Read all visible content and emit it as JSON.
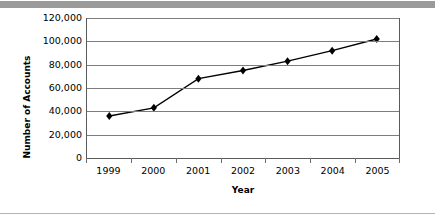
{
  "decor": {
    "top_bar_color": "#9a9a9a",
    "bottom_rule_color": "#b4b4b4"
  },
  "chart_data": {
    "type": "line",
    "title": "",
    "subtitle": "",
    "xlabel": "Year",
    "ylabel": "Number of Accounts",
    "categories": [
      "1999",
      "2000",
      "2001",
      "2002",
      "2003",
      "2004",
      "2005"
    ],
    "values": [
      36000,
      43000,
      68000,
      75000,
      83000,
      92000,
      102000
    ],
    "series": [
      {
        "name": "Number of Accounts",
        "values": [
          36000,
          43000,
          68000,
          75000,
          83000,
          92000,
          102000
        ]
      }
    ],
    "ylim": [
      0,
      120000
    ],
    "ytick_labels": [
      "0",
      "20,000",
      "40,000",
      "60,000",
      "80,000",
      "100,000",
      "120,000"
    ],
    "ytick_values": [
      0,
      20000,
      40000,
      60000,
      80000,
      100000,
      120000
    ],
    "grid": true,
    "grid_axis": "y",
    "legend": false,
    "legend_position": "none",
    "marker": "diamond",
    "marker_color": "#000000",
    "line_color": "#000000",
    "grid_color": "#7d7d7d",
    "axis_color": "#5a5a5a",
    "plot_background": "#ffffff",
    "annotations": []
  }
}
